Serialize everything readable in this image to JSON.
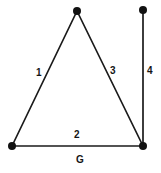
{
  "diagram": {
    "name_label": "G",
    "background_color": "#ffffff",
    "stroke_color": "#1a1a1a",
    "node_color": "#111111",
    "width": 161,
    "height": 173,
    "nodes": [
      {
        "id": "apex",
        "x": 77,
        "y": 11,
        "r": 4.0
      },
      {
        "id": "top-right",
        "x": 143,
        "y": 10,
        "r": 4.0
      },
      {
        "id": "bottom-left",
        "x": 12,
        "y": 146,
        "r": 4.0
      },
      {
        "id": "bottom-right",
        "x": 143,
        "y": 146,
        "r": 4.0
      }
    ],
    "edges": [
      {
        "id": "edge-1",
        "label": "1",
        "from": "apex",
        "to": "bottom-left",
        "x1": 77,
        "y1": 11,
        "x2": 12,
        "y2": 146,
        "label_x": 36,
        "label_y": 68
      },
      {
        "id": "edge-2",
        "label": "2",
        "from": "bottom-left",
        "to": "bottom-right",
        "x1": 12,
        "y1": 146,
        "x2": 143,
        "y2": 146,
        "label_x": 74,
        "label_y": 130
      },
      {
        "id": "edge-3",
        "label": "3",
        "from": "apex",
        "to": "bottom-right",
        "x1": 77,
        "y1": 11,
        "x2": 143,
        "y2": 146,
        "label_x": 110,
        "label_y": 66
      },
      {
        "id": "edge-4",
        "label": "4",
        "from": "top-right",
        "to": "bottom-right",
        "x1": 143,
        "y1": 10,
        "x2": 143,
        "y2": 146,
        "label_x": 147,
        "label_y": 66
      }
    ],
    "name_label_x": 76,
    "name_label_y": 155
  }
}
